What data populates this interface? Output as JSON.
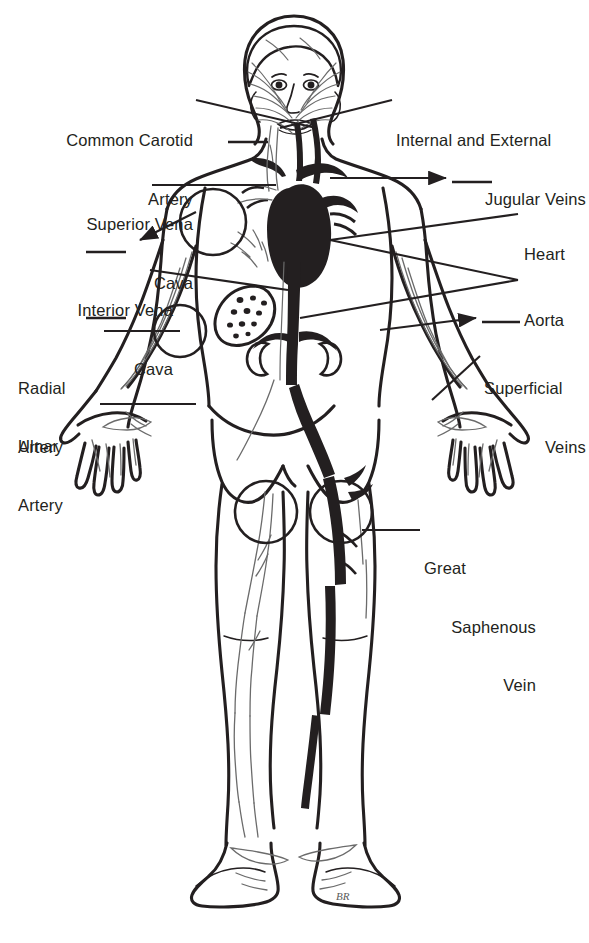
{
  "figure": {
    "background_color": "#ffffff",
    "ink_color": "#231f20",
    "signature": "BR"
  },
  "labels": [
    {
      "id": "common-carotid-artery",
      "lines": [
        "Common Carotid",
        "Artery"
      ],
      "side": "left",
      "x": 18,
      "y": 92,
      "width": 175
    },
    {
      "id": "internal-external-jugular-veins",
      "lines": [
        "Internal and External",
        "Jugular Veins"
      ],
      "side": "right",
      "x": 396,
      "y": 92,
      "width": 185
    },
    {
      "id": "superior-vena-cava",
      "lines": [
        "Superior Vena",
        "Cava"
      ],
      "side": "left",
      "x": 18,
      "y": 176,
      "width": 175
    },
    {
      "id": "heart",
      "lines": [
        "Heart"
      ],
      "side": "right",
      "x": 524,
      "y": 206,
      "width": 60
    },
    {
      "id": "interior-vena-cava",
      "lines": [
        "Interior Vena",
        "Cava"
      ],
      "side": "left",
      "x": 18,
      "y": 262,
      "width": 155
    },
    {
      "id": "aorta",
      "lines": [
        "Aorta"
      ],
      "side": "right",
      "x": 524,
      "y": 272,
      "width": 60
    },
    {
      "id": "radial-artery",
      "lines": [
        "Radial",
        "Artery"
      ],
      "side": "left",
      "x": 18,
      "y": 340,
      "width": 85
    },
    {
      "id": "superficial-veins",
      "lines": [
        "Superficial",
        "Veins"
      ],
      "side": "right",
      "x": 484,
      "y": 340,
      "width": 100
    },
    {
      "id": "ulnar-artery",
      "lines": [
        "Ulnar",
        "Artery"
      ],
      "side": "left",
      "x": 18,
      "y": 398,
      "width": 80
    },
    {
      "id": "great-saphenous-vein",
      "lines": [
        "Great",
        "Saphenous",
        "Vein"
      ],
      "side": "right",
      "x": 424,
      "y": 520,
      "width": 110
    }
  ],
  "highlight_circles": [
    {
      "id": "circle-superior-vena-cava",
      "cx": 213,
      "cy": 222,
      "r": 33
    },
    {
      "id": "circle-radial-artery",
      "cx": 180,
      "cy": 331,
      "r": 26
    },
    {
      "id": "circle-femoral-left",
      "cx": 266,
      "cy": 512,
      "r": 31
    },
    {
      "id": "circle-femoral-right",
      "cx": 341,
      "cy": 512,
      "r": 31
    }
  ],
  "anatomy_parts": [
    "head",
    "face",
    "neck",
    "shoulders",
    "chest",
    "breasts",
    "heart",
    "liver",
    "kidneys",
    "abdomen",
    "pelvis",
    "arms",
    "hands",
    "thighs",
    "knees",
    "lower legs",
    "feet"
  ],
  "vessel_groups": [
    {
      "name": "arteries",
      "rendering": "solid dark filled",
      "color": "#231f20"
    },
    {
      "name": "veins",
      "rendering": "thin outline",
      "color": "#6b6b6b"
    }
  ]
}
